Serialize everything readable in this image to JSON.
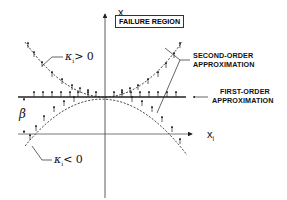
{
  "figure": {
    "axes": {
      "vertical_label": "x",
      "vertical_subscript": "n",
      "horizontal_label": "x",
      "horizontal_subscript": "i"
    },
    "region_label": "FAILURE REGION",
    "annotations": {
      "second_order_line1": "SECOND-ORDER",
      "second_order_line2": "APPROXIMATION",
      "first_order_line1": "FIRST-ORDER",
      "first_order_line2": "APPROXIMATION",
      "kappa_positive_symbol": "κ",
      "kappa_positive_subscript": "i",
      "kappa_positive_relation": "> 0",
      "kappa_negative_symbol": "κ",
      "kappa_negative_subscript": "i",
      "kappa_negative_relation": "< 0",
      "beta_symbol": "β"
    },
    "colors": {
      "ink": "#222222",
      "background": "#ffffff"
    }
  }
}
